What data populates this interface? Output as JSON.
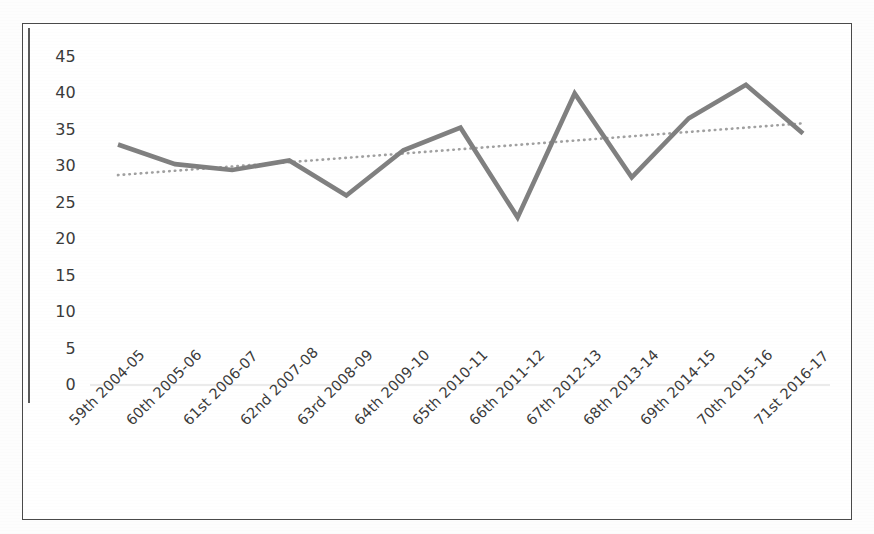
{
  "chart_data": {
    "type": "line",
    "title": "",
    "subtitle": "",
    "xlabel": "",
    "ylabel": "",
    "ylim": [
      0,
      45
    ],
    "yticks": [
      0,
      5,
      10,
      15,
      20,
      25,
      30,
      35,
      40,
      45
    ],
    "grid": false,
    "legend": "none",
    "categories": [
      "59th 2004-05",
      "60th 2005-06",
      "61st 2006-07",
      "62nd 2007-08",
      "63rd 2008-09",
      "64th 2009-10",
      "65th 2010-11",
      "66th 2011-12",
      "67th 2012-13",
      "68th 2013-14",
      "69th 2014-15",
      "70th 2015-16",
      "71st 2016-17"
    ],
    "series": [
      {
        "name": "value",
        "style": "solid",
        "color": "#808080",
        "values": [
          33.0,
          30.3,
          29.5,
          30.8,
          26.0,
          32.2,
          35.3,
          23.0,
          40.0,
          28.5,
          36.6,
          41.2,
          34.5
        ]
      },
      {
        "name": "trendline",
        "style": "dotted",
        "color": "#a0a0a0",
        "values": [
          28.8,
          29.4,
          30.0,
          30.6,
          31.2,
          31.8,
          32.4,
          33.0,
          33.5,
          34.1,
          34.7,
          35.3,
          35.9
        ]
      }
    ],
    "baseline": {
      "value": 0,
      "color": "#e4e4e4"
    },
    "colors": {
      "series_line": "#808080",
      "trend_line": "#a0a0a0",
      "axis": "#5a5a5a",
      "frame": "#4a4a4a",
      "text": "#3b3b3b",
      "background": "#ffffff"
    }
  },
  "axis": {
    "y_labels": [
      "45",
      "40",
      "35",
      "30",
      "25",
      "20",
      "15",
      "10",
      "5",
      "0"
    ]
  }
}
